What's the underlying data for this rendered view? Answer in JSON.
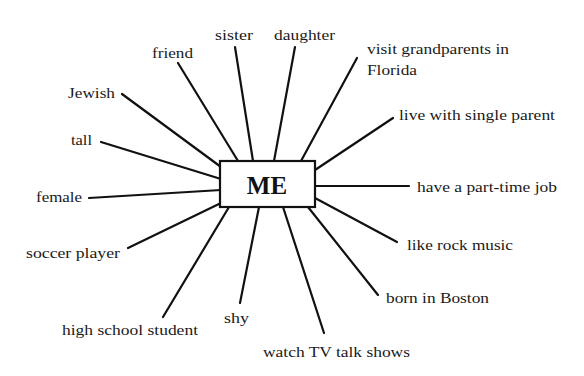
{
  "diagram": {
    "type": "mind-map",
    "center": {
      "label": "ME"
    },
    "colors": {
      "line": "#111111",
      "text": "#1a1a1a",
      "background": "#ffffff"
    },
    "nodes": [
      {
        "id": "sister",
        "label": "sister"
      },
      {
        "id": "daughter",
        "label": "daughter"
      },
      {
        "id": "friend",
        "label": "friend"
      },
      {
        "id": "visit",
        "label_line1": "visit grandparents in",
        "label_line2": "Florida"
      },
      {
        "id": "jewish",
        "label": "Jewish"
      },
      {
        "id": "live",
        "label": "live with single parent"
      },
      {
        "id": "tall",
        "label": "tall"
      },
      {
        "id": "female",
        "label": "female"
      },
      {
        "id": "job",
        "label": "have a part-time job"
      },
      {
        "id": "soccer",
        "label": "soccer player"
      },
      {
        "id": "rock",
        "label": "like rock music"
      },
      {
        "id": "boston",
        "label": "born in Boston"
      },
      {
        "id": "highschool",
        "label": "high school student"
      },
      {
        "id": "shy",
        "label": "shy"
      },
      {
        "id": "tv",
        "label": "watch TV talk shows"
      }
    ]
  }
}
